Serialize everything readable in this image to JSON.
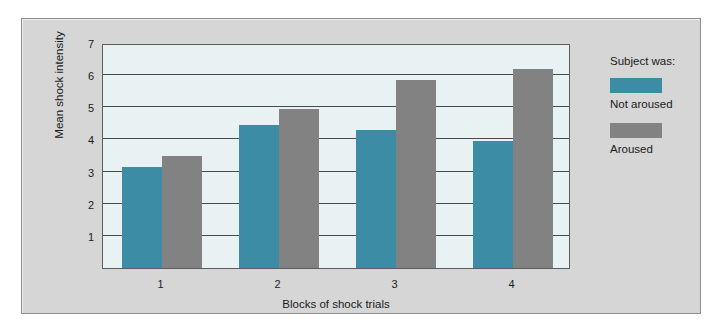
{
  "chart_data": {
    "type": "bar",
    "title": "",
    "xlabel": "Blocks of shock trials",
    "ylabel": "Mean shock intensity",
    "categories": [
      "1",
      "2",
      "3",
      "4"
    ],
    "yticks": [
      7,
      6,
      5,
      4,
      3,
      2,
      1
    ],
    "ylim": [
      0,
      7
    ],
    "grid": true,
    "legend_position": "right",
    "legend_title": "Subject was:",
    "series": [
      {
        "name": "Not aroused",
        "color": "#3c8ca6",
        "values": [
          3.15,
          4.45,
          4.3,
          3.95
        ]
      },
      {
        "name": "Aroused",
        "color": "#828282",
        "values": [
          3.5,
          4.95,
          5.85,
          6.2
        ]
      }
    ]
  },
  "colors": {
    "panel_background": "#d6d6d6",
    "plot_background": "#e9f2f2",
    "axis": "#5c5c5c",
    "gridline": "#4a4a4a",
    "not_aroused": "#3c8ca6",
    "aroused": "#828282"
  }
}
